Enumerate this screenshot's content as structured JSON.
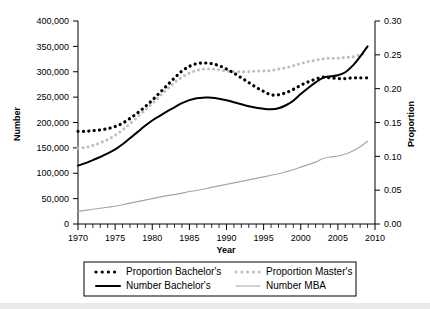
{
  "chart_data": {
    "type": "line",
    "title": "",
    "xlabel": "Year",
    "ylabel": "Number",
    "y2label": "Proportion",
    "xlim": [
      1970,
      2010
    ],
    "ylim": [
      0,
      400000
    ],
    "y2lim": [
      0,
      0.3
    ],
    "grid": false,
    "legend_position": "bottom",
    "x_ticks": [
      1970,
      1975,
      1980,
      1985,
      1990,
      1995,
      2000,
      2005,
      2010
    ],
    "x_tick_labels": [
      "1970",
      "1975",
      "1980",
      "1985",
      "1990",
      "1995",
      "2000",
      "2005",
      "2010"
    ],
    "x_minor_tick_step": 1,
    "y_ticks": [
      0,
      50000,
      100000,
      150000,
      200000,
      250000,
      300000,
      350000,
      400000
    ],
    "y_tick_labels": [
      "0",
      "50,000",
      "100,000",
      "150,000",
      "200,000",
      "250,000",
      "300,000",
      "350,000",
      "400,000"
    ],
    "y2_ticks": [
      0.0,
      0.05,
      0.1,
      0.15,
      0.2,
      0.25,
      0.3
    ],
    "y2_tick_labels": [
      "0.00",
      "0.05",
      "0.10",
      "0.15",
      "0.20",
      "0.25",
      "0.30"
    ],
    "x": [
      1970,
      1971,
      1972,
      1973,
      1974,
      1975,
      1976,
      1977,
      1978,
      1979,
      1980,
      1981,
      1982,
      1983,
      1984,
      1985,
      1986,
      1987,
      1988,
      1989,
      1990,
      1991,
      1992,
      1993,
      1994,
      1995,
      1996,
      1997,
      1998,
      1999,
      2000,
      2001,
      2002,
      2003,
      2004,
      2005,
      2006,
      2007,
      2008,
      2009
    ],
    "series": [
      {
        "name": "Proportion Bachelor's",
        "axis": "right",
        "style": "dotted",
        "color": "#000000",
        "width": 3.2,
        "values": [
          0.137,
          0.137,
          0.138,
          0.139,
          0.141,
          0.144,
          0.149,
          0.156,
          0.164,
          0.173,
          0.183,
          0.194,
          0.205,
          0.216,
          0.226,
          0.233,
          0.237,
          0.238,
          0.237,
          0.234,
          0.229,
          0.223,
          0.216,
          0.209,
          0.202,
          0.196,
          0.191,
          0.191,
          0.194,
          0.199,
          0.205,
          0.21,
          0.214,
          0.217,
          0.216,
          0.215,
          0.215,
          0.216,
          0.216,
          0.216
        ]
      },
      {
        "name": "Proportion Master's",
        "axis": "right",
        "style": "dotted",
        "color": "#bfbfbf",
        "width": 3.0,
        "values": [
          0.112,
          0.113,
          0.116,
          0.12,
          0.125,
          0.131,
          0.139,
          0.148,
          0.158,
          0.168,
          0.178,
          0.189,
          0.199,
          0.209,
          0.217,
          0.223,
          0.227,
          0.229,
          0.229,
          0.228,
          0.226,
          0.225,
          0.225,
          0.225,
          0.226,
          0.226,
          0.227,
          0.229,
          0.231,
          0.234,
          0.237,
          0.24,
          0.242,
          0.244,
          0.245,
          0.245,
          0.246,
          0.247,
          0.25,
          0.254
        ]
      },
      {
        "name": "Number Bachelor's",
        "axis": "left",
        "style": "solid",
        "color": "#000000",
        "width": 2.0,
        "values": [
          115000,
          120000,
          126000,
          132000,
          139000,
          147000,
          157000,
          169000,
          181000,
          193000,
          204000,
          213000,
          222000,
          230000,
          238000,
          244000,
          248000,
          249000,
          249000,
          247000,
          244000,
          240000,
          236000,
          232000,
          229000,
          227000,
          226000,
          228000,
          234000,
          243000,
          256000,
          268000,
          279000,
          288000,
          291000,
          293000,
          299000,
          312000,
          330000,
          350000
        ]
      },
      {
        "name": "Number MBA",
        "axis": "left",
        "style": "solid",
        "color": "#a6a6a6",
        "width": 1.2,
        "values": [
          25000,
          27000,
          29000,
          31000,
          33000,
          35000,
          38000,
          41000,
          44000,
          47000,
          50000,
          53000,
          56000,
          58000,
          61000,
          64000,
          66000,
          69000,
          72000,
          75000,
          78000,
          81000,
          84000,
          87000,
          90000,
          93000,
          96000,
          99000,
          103000,
          107000,
          112000,
          117000,
          122000,
          129000,
          132000,
          134000,
          138000,
          144000,
          152000,
          163000
        ]
      }
    ]
  },
  "legend": {
    "items": [
      {
        "label": "Proportion Bachelor's",
        "marker": "dotted-thick-black"
      },
      {
        "label": "Proportion Master's",
        "marker": "dotted-gray"
      },
      {
        "label": "Number Bachelor's",
        "marker": "solid-thick-black"
      },
      {
        "label": "Number MBA",
        "marker": "solid-thin-gray"
      }
    ]
  }
}
